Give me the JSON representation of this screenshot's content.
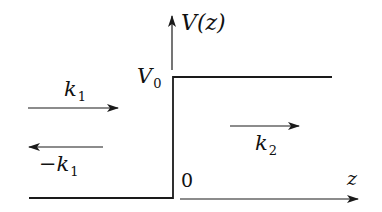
{
  "diagram": {
    "axes": {
      "vertical_label": "V(z)",
      "horizontal_label": "z",
      "origin_label": "0"
    },
    "potential": {
      "step_height_label": "V",
      "step_height_sub": "0"
    },
    "waves": [
      {
        "name": "incident",
        "label_main": "k",
        "label_sub": "1",
        "direction": "right"
      },
      {
        "name": "reflected",
        "label_prefix": "−",
        "label_main": "k",
        "label_sub": "1",
        "direction": "left"
      },
      {
        "name": "transmitted",
        "label_main": "k",
        "label_sub": "2",
        "direction": "right"
      }
    ],
    "colors": {
      "line": "#1a1a1a",
      "background": "#ffffff"
    }
  }
}
